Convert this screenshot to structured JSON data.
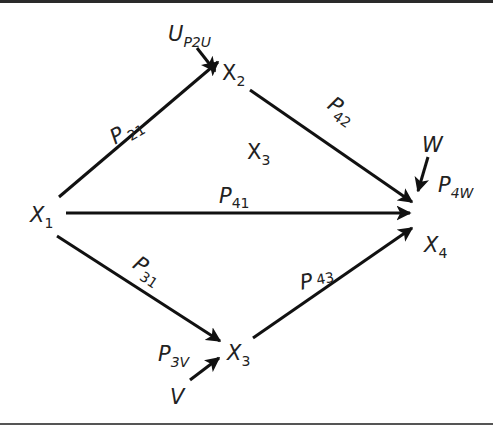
{
  "diagram": {
    "type": "path-diagram",
    "nodes": [
      {
        "id": "X1",
        "base": "X",
        "sub": "1"
      },
      {
        "id": "X2",
        "base": "X",
        "sub": "2"
      },
      {
        "id": "X3_mid",
        "base": "X",
        "sub": "3"
      },
      {
        "id": "X3",
        "base": "X",
        "sub": "3"
      },
      {
        "id": "X4",
        "base": "X",
        "sub": "4"
      },
      {
        "id": "U",
        "base": "U",
        "sub": "P2U"
      },
      {
        "id": "W",
        "base": "W",
        "sub": ""
      },
      {
        "id": "V",
        "base": "V",
        "sub": ""
      }
    ],
    "edges": [
      {
        "from": "X1",
        "to": "X2",
        "label_base": "P",
        "label_sub": "21"
      },
      {
        "from": "X1",
        "to": "X4",
        "label_base": "P",
        "label_sub": "41"
      },
      {
        "from": "X1",
        "to": "X3",
        "label_base": "P",
        "label_sub": "31"
      },
      {
        "from": "X2",
        "to": "X4",
        "label_base": "P",
        "label_sub": "42"
      },
      {
        "from": "X3",
        "to": "X4",
        "label_base": "P",
        "label_sub": "43"
      },
      {
        "from": "U",
        "to": "X2",
        "label_base": "",
        "label_sub": ""
      },
      {
        "from": "W",
        "to": "X4",
        "label_base": "P",
        "label_sub": "4W"
      },
      {
        "from": "V",
        "to": "X3",
        "label_base": "P",
        "label_sub": "3V"
      }
    ]
  },
  "labels": {
    "x1": {
      "base": "X",
      "sub": "1"
    },
    "x2": {
      "base": "X",
      "sub": "2"
    },
    "x3_mid": {
      "base": "X",
      "sub": "3"
    },
    "x3": {
      "base": "X",
      "sub": "3"
    },
    "x4": {
      "base": "X",
      "sub": "4"
    },
    "u": {
      "base": "U",
      "sub": "P2U"
    },
    "w": {
      "base": "W"
    },
    "v": {
      "base": "V"
    },
    "p21": {
      "base": "P",
      "sub": "21"
    },
    "p41": {
      "base": "P",
      "sub": "41"
    },
    "p31": {
      "base": "P",
      "sub": "31"
    },
    "p42": {
      "base": "P",
      "sub": "42"
    },
    "p43": {
      "base": "P",
      "sub": "43"
    },
    "p4w": {
      "base": "P",
      "sub": "4W"
    },
    "p3v": {
      "base": "P",
      "sub": "3V"
    }
  },
  "colors": {
    "line": "#111111",
    "text": "#222222",
    "background": "#ffffff"
  }
}
